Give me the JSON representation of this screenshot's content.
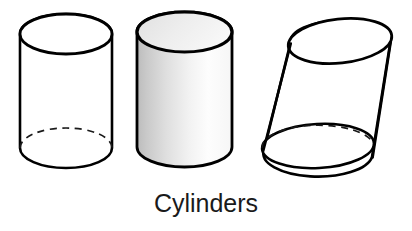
{
  "figure": {
    "caption": "Cylinders",
    "background_color": "#ffffff",
    "stroke_color": "#000000",
    "caption_color": "#1a1a1a",
    "shape_count": 3,
    "shapes": [
      {
        "name": "right-cylinder-outline",
        "label": "Cylinder",
        "style": "outline",
        "fill_color": "#ffffff",
        "hidden_edge": "dashed",
        "orientation": "upright"
      },
      {
        "name": "right-cylinder-shaded",
        "label": "Cylinder",
        "style": "shaded",
        "fill_gradient_from": "#c2c2c2",
        "fill_gradient_to": "#fdfdfd",
        "top_face_color": "#ececec",
        "hidden_edge": "none",
        "orientation": "upright"
      },
      {
        "name": "oblique-cylinder-outline",
        "label": "Oblique cylinder",
        "style": "outline",
        "fill_color": "#ffffff",
        "hidden_edge": "dashed",
        "orientation": "oblique"
      }
    ]
  }
}
